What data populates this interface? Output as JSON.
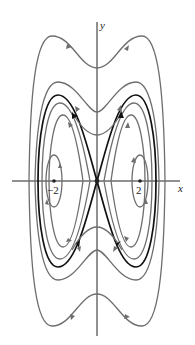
{
  "figure": {
    "type": "phase-portrait",
    "axes": {
      "x_label": "x",
      "y_label": "y"
    },
    "tick_labels": {
      "neg_two": "−2",
      "pos_two": "2"
    },
    "equilibria": [
      {
        "label": "saddle",
        "x": 0,
        "y": 0
      },
      {
        "label": "center",
        "x": -2,
        "y": 0
      },
      {
        "label": "center",
        "x": 2,
        "y": 0
      }
    ],
    "colors": {
      "separatrix": "#111111",
      "trajectory": "#6e6e6e",
      "axis": "#222222"
    }
  }
}
